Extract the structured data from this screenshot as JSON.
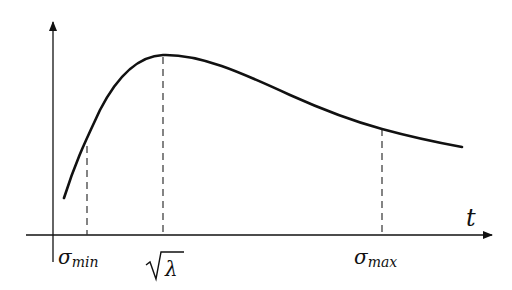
{
  "diagram": {
    "title": "",
    "x_axis_label": "t",
    "ticks": [
      {
        "id": "sigma_min",
        "symbol": "σ",
        "sub": "min",
        "x": 87,
        "top": 145
      },
      {
        "id": "sqrt_lambda",
        "symbol": "√λ",
        "sub": "",
        "x": 163,
        "top": 57
      },
      {
        "id": "sigma_max",
        "symbol": "σ",
        "sub": "max",
        "x": 382,
        "top": 128
      }
    ],
    "curve": {
      "description": "Rises steeply from small t, peaks at sqrt(lambda), then decays slowly toward sigma_max and beyond",
      "stroke": "#111111"
    },
    "colors": {
      "axis": "#111111",
      "curve": "#111111",
      "dash": "#333333"
    }
  }
}
